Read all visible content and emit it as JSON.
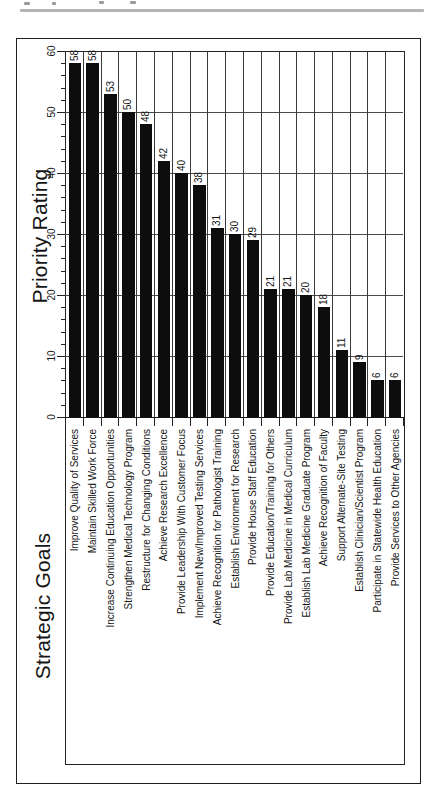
{
  "page": {
    "header_rule_color": "#b4b4b4",
    "ink_color": "#1a1a1a",
    "bar_color": "#0d0d0d"
  },
  "chart_data": {
    "type": "bar",
    "orientation": "rotated-90-ccw-on-page",
    "title": "",
    "value_axis": {
      "label": "Priority Rating",
      "min": 0,
      "max": 60,
      "major_tick": 10,
      "minor_tick": 2,
      "tick_labels": [
        "0",
        "10",
        "20",
        "30",
        "40",
        "50",
        "60"
      ]
    },
    "category_axis": {
      "label": "Strategic Goals"
    },
    "categories": [
      "Improve Quality of Services",
      "Maintain Skilled Work Force",
      "Increase Continuing Education Opportunities",
      "Strengthen Medical Technology Program",
      "Restructure for Changing Conditions",
      "Achieve Research Excellence",
      "Provide Leadership With Customer Focus",
      "Implement New/Improved Testing Services",
      "Achieve Recognition for Pathologist Training",
      "Establish Environment for Research",
      "Provide House Staff Education",
      "Provide Education/Training for Others",
      "Provide Lab Medicine in Medical Curriculum",
      "Establish Lab Medicine Graduate Program",
      "Achieve Recognition of Faculty",
      "Support Alternate-Site Testing",
      "Establish Clinician/Scientist Program",
      "Participate in Statewide Health Education",
      "Provide Services to Other Agencies"
    ],
    "values": [
      58,
      58,
      53,
      50,
      48,
      42,
      40,
      38,
      31,
      30,
      29,
      21,
      21,
      20,
      18,
      11,
      9,
      6,
      6
    ],
    "grid": true,
    "data_labels": true,
    "legend": "none"
  }
}
